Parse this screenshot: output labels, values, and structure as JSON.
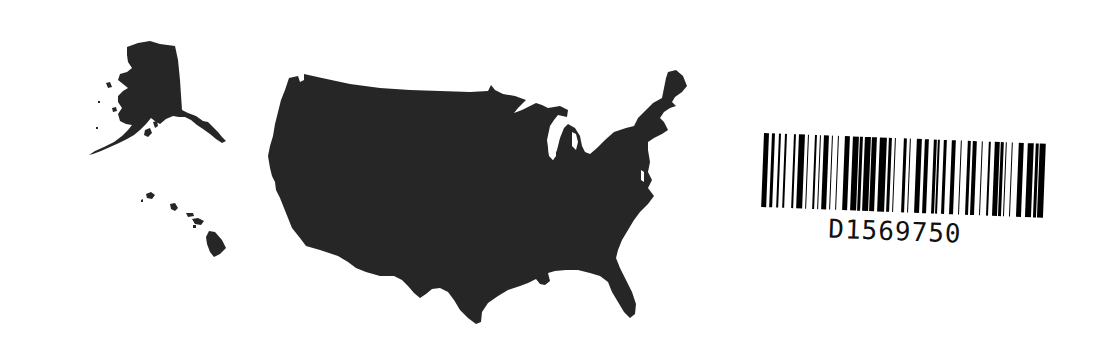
{
  "figure": {
    "colors": {
      "background": "#ffffff",
      "land_fill": "#262626",
      "barcode_ink": "#000000"
    },
    "regions": [
      {
        "name": "Alaska",
        "icon": "alaska-silhouette"
      },
      {
        "name": "Hawaii",
        "icon": "hawaii-silhouette"
      },
      {
        "name": "Contiguous United States",
        "icon": "contiguous-us-silhouette"
      }
    ]
  },
  "barcode": {
    "value": "D1569750",
    "pattern": [
      3,
      2,
      2,
      3,
      1,
      3,
      1,
      5,
      1,
      2,
      4,
      2,
      1,
      4,
      1,
      2,
      1,
      2,
      3,
      2,
      1,
      3,
      1,
      4,
      3,
      2,
      4,
      1,
      2,
      1,
      4,
      1,
      3,
      2,
      5,
      1,
      2,
      2,
      1,
      5,
      2,
      2,
      1,
      4,
      3,
      2,
      3,
      3,
      2,
      1,
      1,
      3,
      2,
      3,
      3,
      3,
      1,
      4,
      2,
      1,
      3,
      3,
      1,
      4,
      1,
      3,
      3,
      1,
      2,
      1,
      1,
      3,
      1,
      4,
      3,
      3,
      4,
      1,
      2,
      1,
      4
    ]
  }
}
